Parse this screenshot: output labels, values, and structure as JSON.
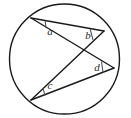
{
  "figure": {
    "name": "circle-with-inscribed-angles",
    "type": "geometry-diagram",
    "background_color": "#ffffff",
    "stroke_color": "#1a1a1a",
    "label_color": "#2a2a2a"
  },
  "circle": {
    "name": "main-circle",
    "center_x": 64.5,
    "center_y": 59,
    "radius": 55,
    "stroke_width": 1.4,
    "fill": "none"
  },
  "points": [
    {
      "id": "A",
      "x": 31,
      "y": 18,
      "name": "vertex-a-top-left"
    },
    {
      "id": "B",
      "x": 104,
      "y": 31,
      "name": "vertex-b-upper-right"
    },
    {
      "id": "D",
      "x": 114,
      "y": 68,
      "name": "vertex-d-lower-right"
    },
    {
      "id": "C",
      "x": 31,
      "y": 100,
      "name": "vertex-c-bottom-left"
    }
  ],
  "chords": [
    {
      "id": "AB",
      "x1": 31,
      "y1": 18,
      "x2": 104,
      "y2": 31,
      "name": "chord-a-to-b"
    },
    {
      "id": "AD",
      "x1": 31,
      "y1": 18,
      "x2": 114,
      "y2": 68,
      "name": "chord-a-to-d"
    },
    {
      "id": "BC",
      "x1": 104,
      "y1": 31,
      "x2": 31,
      "y2": 100,
      "name": "chord-b-to-c"
    },
    {
      "id": "CD",
      "x1": 31,
      "y1": 100,
      "x2": 114,
      "y2": 68,
      "name": "chord-c-to-d"
    }
  ],
  "intersection": {
    "x": 78,
    "y": 52,
    "name": "chord-crossing-point"
  },
  "angle_marks": [
    {
      "id": "a",
      "label": "a",
      "label_x": 50,
      "label_y": 32,
      "arc_path": "M 44.8 21.0 A 15 15 0 0 1 45.5 27.3",
      "tick_x1": 45.2,
      "tick_y1": 20.6,
      "tick_x2": 45.9,
      "tick_y2": 27.6,
      "name": "angle-mark-a"
    },
    {
      "id": "b",
      "label": "b",
      "label_x": 88,
      "label_y": 36,
      "arc_path": "M 90.2 29.5 A 14 14 0 0 0 92.6 39.8",
      "tick_x1": 90.2,
      "tick_y1": 29.2,
      "tick_x2": 93.0,
      "tick_y2": 40.0,
      "name": "angle-mark-b"
    },
    {
      "id": "c",
      "label": "c",
      "label_x": 50,
      "label_y": 86,
      "arc_path": "M 43.0 88.5 A 15 15 0 0 0 44.8 95.5",
      "tick_x1": 43.0,
      "tick_y1": 88.2,
      "tick_x2": 45.0,
      "tick_y2": 95.8,
      "name": "angle-mark-c"
    },
    {
      "id": "d",
      "label": "d",
      "label_x": 97,
      "label_y": 68,
      "arc_path": "M 101.5 61.8 A 14 14 0 0 0 102.8 72.2",
      "tick_x1": 101.5,
      "tick_y1": 61.5,
      "tick_x2": 103.0,
      "tick_y2": 72.4,
      "name": "angle-mark-d"
    }
  ]
}
